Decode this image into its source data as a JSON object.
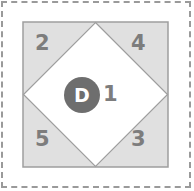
{
  "figure": {
    "canvas": {
      "width": 194,
      "height": 191,
      "background": "#ffffff"
    },
    "outer_frame": {
      "style": "dashed",
      "color": "#9a9a9a"
    },
    "square": {
      "fill": "#e0e0e0",
      "stroke": "#9e9e9e",
      "x": 23,
      "y": 22,
      "width": 145,
      "height": 145
    },
    "diamond": {
      "fill": "#ffffff",
      "stroke": "#9e9e9e",
      "vertices": "95.5,22 168,94.5 95.5,167 23,94.5"
    },
    "regions": [
      {
        "id": "region-2",
        "label": "2",
        "position": "top-left"
      },
      {
        "id": "region-4",
        "label": "4",
        "position": "top-right"
      },
      {
        "id": "region-5",
        "label": "5",
        "position": "bottom-left"
      },
      {
        "id": "region-3",
        "label": "3",
        "position": "bottom-right"
      },
      {
        "id": "region-1",
        "label": "1",
        "position": "center"
      }
    ],
    "node": {
      "label": "D",
      "fill": "#6e6e6e",
      "text_color": "#ffffff"
    },
    "colors": {
      "square_fill": "#e0e0e0",
      "diamond_fill": "#ffffff",
      "stroke": "#9e9e9e",
      "label_text": "#7d7d7d",
      "node_fill": "#6e6e6e",
      "dashed_border": "#9a9a9a"
    }
  }
}
